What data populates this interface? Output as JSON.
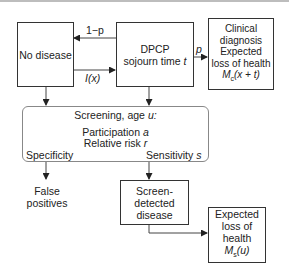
{
  "diagram": {
    "nodes": {
      "no_disease": {
        "label": "No disease"
      },
      "dpcp": {
        "line1": "DPCP",
        "line2_text": "sojourn time ",
        "line2_var": "t"
      },
      "clinical": {
        "line1": "Clinical",
        "line2": "diagnosis",
        "line3": "Expected",
        "line4": "loss of health",
        "formula_var": "M",
        "formula_sub": "c",
        "formula_arg": "(x + t)"
      },
      "screening": {
        "title_text": "Screening, age ",
        "title_var": "u:",
        "participation_text": "Participation ",
        "participation_var": "a",
        "relrisk_text": "Relative risk ",
        "relrisk_var": "r",
        "specificity": "Specificity",
        "sensitivity_text": "Sensitivity ",
        "sensitivity_var": "s"
      },
      "false_positives": {
        "line1": "False",
        "line2": "positives"
      },
      "screen_detected": {
        "line1": "Screen-",
        "line2": "detected",
        "line3": "disease"
      },
      "expected_loss": {
        "line1": "Expected",
        "line2": "loss of",
        "line3": "health",
        "formula_var": "M",
        "formula_sub": "s",
        "formula_arg": "(u)"
      }
    },
    "edges": {
      "one_minus_p": "1−p",
      "incidence": "I(x)",
      "p": "p"
    }
  }
}
